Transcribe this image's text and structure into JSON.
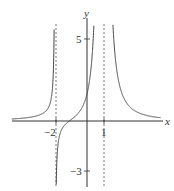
{
  "chart_data": {
    "type": "line",
    "title": "",
    "xlabel": "x",
    "ylabel": "y",
    "x_ticks": [
      {
        "value": -2,
        "label": "-2"
      },
      {
        "value": 1,
        "label": "1"
      }
    ],
    "y_ticks": [
      {
        "value": 5,
        "label": "5"
      },
      {
        "value": -3,
        "label": "-3"
      }
    ],
    "vertical_asymptotes": [
      -2,
      1
    ],
    "horizontal_asymptote": 0,
    "xlim": [
      -5.2,
      4.5
    ],
    "ylim": [
      -4.0,
      7.2
    ],
    "grid": false,
    "legend": null,
    "series": [
      {
        "name": "f(x)",
        "description": "curve with vertical asymptotes at x=-2 and x=1, approaching 0 as x→±∞; positive left of -2, from -∞ rising through near origin to +∞ at x=1, then decreasing to 0"
      }
    ]
  },
  "labels": {
    "x_axis": "x",
    "y_axis": "y",
    "tick_neg2": "−2",
    "tick_1": "1",
    "tick_5": "5",
    "tick_neg3": "−3"
  }
}
